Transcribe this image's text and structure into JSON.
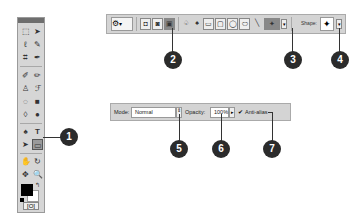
{
  "toolbox": {
    "tools": [
      [
        "⬚",
        "➤"
      ],
      [
        "ℓ",
        "✎"
      ],
      [
        "⌗",
        "✒"
      ],
      [
        "✐",
        "✏"
      ],
      [
        "♙",
        "ℱ"
      ],
      [
        "◌",
        "■"
      ],
      [
        "◊",
        "●"
      ],
      [
        "♠",
        "T"
      ],
      [
        "➤",
        "▭"
      ],
      [
        "✋",
        "↻"
      ],
      [
        "✥",
        "🔍"
      ]
    ],
    "selected_tool": "custom-shape",
    "swap_glyph": "↰",
    "quick_mask_glyph": "[O]"
  },
  "top_toolbar": {
    "preset_glyph": "⚙",
    "preset_arrow": "▾",
    "mode_buttons": [
      "◘",
      "◙",
      "▣"
    ],
    "shape_tools": [
      "♤",
      "♠",
      "▭",
      "▢",
      "◯",
      "⬭",
      "╲",
      "✦"
    ],
    "geometry_arrow": "▾",
    "shape_label": "Shape:",
    "shape_glyph": "✦",
    "shape_arrow": "▾"
  },
  "options_bar": {
    "mode_label": "Mode:",
    "mode_value": "Normal",
    "mode_stepper": "⇕",
    "opacity_label": "Opacity:",
    "opacity_value": "100%",
    "opacity_arrow": "▸",
    "antialias_check": "✔",
    "antialias_label": "Anti-alias",
    "antialias_checked": true
  },
  "callouts": [
    "1",
    "2",
    "3",
    "4",
    "5",
    "6",
    "7"
  ]
}
